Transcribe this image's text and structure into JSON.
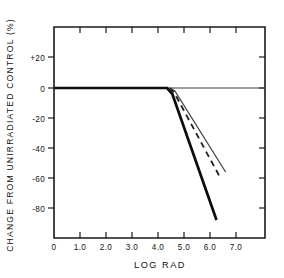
{
  "chart_data": {
    "type": "line",
    "title": "",
    "xlabel": "LOG  RAD",
    "ylabel": "CHANGE FROM UNIRRADIATED CONTROL (%)",
    "xlim": [
      0,
      7.4
    ],
    "ylim": [
      -92,
      28
    ],
    "grid": false,
    "legend_position": "none",
    "xticks": [
      "0",
      "1.0",
      "2.0",
      "3.0",
      "4.0",
      "5.0",
      "6.0",
      "7.0"
    ],
    "xtick_values": [
      0,
      1.0,
      2.0,
      3.0,
      4.0,
      5.0,
      6.0,
      7.0
    ],
    "yticks": [
      "+20",
      "0",
      "-20",
      "-40",
      "-60",
      "-80"
    ],
    "ytick_values": [
      20,
      0,
      -20,
      -40,
      -60,
      -80
    ],
    "series": [
      {
        "name": "steep-response-curve",
        "style": "solid-thick",
        "x": [
          0.0,
          4.35,
          4.55,
          6.25
        ],
        "y": [
          0,
          0,
          -4,
          -88
        ]
      },
      {
        "name": "intermediate-response-curve",
        "style": "dashed",
        "x": [
          4.45,
          4.62,
          6.4
        ],
        "y": [
          0,
          -3,
          -60
        ]
      },
      {
        "name": "shallow-response-curve",
        "style": "solid-thin",
        "x": [
          4.45,
          4.65,
          6.6
        ],
        "y": [
          0,
          -2,
          -56
        ]
      }
    ],
    "annotations": []
  },
  "figure": {
    "y_axis_label": "CHANGE FROM UNIRRADIATED CONTROL (%)",
    "x_axis_label": "LOG  RAD"
  }
}
